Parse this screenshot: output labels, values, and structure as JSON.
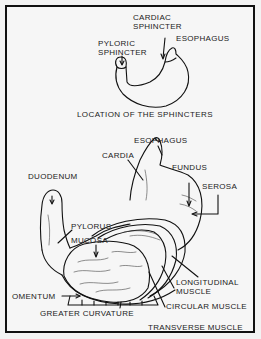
{
  "figure": {
    "top_diagram": {
      "caption": "LOCATION OF THE SPHINCTERS",
      "labels": {
        "cardiac_line1": "CARDIAC",
        "cardiac_line2": "SPHINCTER",
        "esophagus": "ESOPHAGUS",
        "pyloric_line1": "PYLORIC",
        "pyloric_line2": "SPHINCTER"
      }
    },
    "bottom_diagram": {
      "labels": {
        "esophagus": "ESOPHAGUS",
        "cardia": "CARDIA",
        "fundus": "FUNDUS",
        "serosa": "SEROSA",
        "duodenum": "DUODENUM",
        "pylorus": "PYLORUS",
        "mucosa": "MUCOSA",
        "longitudinal_line1": "LONGITUDINAL",
        "longitudinal_line2": "MUSCLE",
        "circular": "CIRCULAR MUSCLE",
        "omentum": "OMENTUM",
        "greater_curvature": "GREATER CURVATURE",
        "transverse": "TRANSVERSE MUSCLE"
      }
    }
  }
}
